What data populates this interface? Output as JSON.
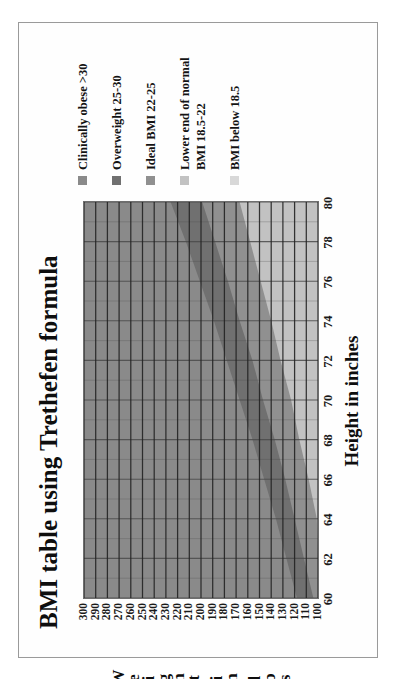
{
  "chart_data": {
    "type": "area",
    "title": "BMI table using Trethefen formula",
    "xlabel": "Height in inches",
    "ylabel": "Weight in lbs",
    "ylabel_letters": [
      "W",
      "e",
      "i",
      "g",
      "h",
      "t",
      "",
      "i",
      "n",
      "",
      "l",
      "b",
      "s"
    ],
    "xlim": [
      60,
      80
    ],
    "ylim": [
      100,
      300
    ],
    "grid": true,
    "legend_position": "right",
    "x": [
      60,
      62,
      64,
      66,
      68,
      70,
      72,
      74,
      76,
      78,
      80
    ],
    "xticklabels": [
      "60",
      "62",
      "64",
      "66",
      "68",
      "70",
      "72",
      "74",
      "76",
      "78",
      "80"
    ],
    "yticklabels": [
      "300",
      "290",
      "280",
      "270",
      "260",
      "250",
      "240",
      "230",
      "220",
      "210",
      "200",
      "190",
      "180",
      "170",
      "160",
      "150",
      "140",
      "130",
      "120",
      "110",
      "100"
    ],
    "yticks": [
      300,
      290,
      280,
      270,
      260,
      250,
      240,
      230,
      220,
      210,
      200,
      190,
      180,
      170,
      160,
      150,
      140,
      130,
      120,
      110,
      100
    ],
    "series": [
      {
        "name": "Clinically obese >30",
        "color": "#8a8a8a",
        "bmi_threshold": 30,
        "boundary_weights_lbs": [
          141,
          152,
          163,
          175,
          187,
          200,
          213,
          227,
          241,
          256,
          271
        ]
      },
      {
        "name": "Overweight 25-30",
        "color": "#707070",
        "bmi_threshold": 25,
        "boundary_weights_lbs": [
          118,
          127,
          136,
          146,
          156,
          167,
          178,
          189,
          201,
          213,
          226
        ]
      },
      {
        "name": "Ideal BMI 22-25",
        "color": "#909090",
        "bmi_threshold": 22,
        "boundary_weights_lbs": [
          104,
          112,
          120,
          128,
          137,
          147,
          156,
          167,
          177,
          188,
          199
        ]
      },
      {
        "name": "Lower end of normal BMI 18.5-22",
        "color": "#c2c2c2",
        "bmi_threshold": 18.5,
        "boundary_weights_lbs": [
          87,
          94,
          101,
          108,
          116,
          123,
          132,
          140,
          149,
          158,
          167
        ]
      },
      {
        "name": "BMI below 18.5",
        "color": "#d8d8d8",
        "bmi_threshold": 0,
        "boundary_weights_lbs": [
          100,
          100,
          100,
          100,
          100,
          100,
          100,
          100,
          100,
          100,
          100
        ]
      }
    ]
  },
  "legend": [
    {
      "label": "Clinically obese >30",
      "color": "#8a8a8a"
    },
    {
      "label": "Overweight 25-30",
      "color": "#707070"
    },
    {
      "label": "Ideal BMI 22-25",
      "color": "#909090"
    },
    {
      "label": "Lower end of normal BMI 18.5-22",
      "color": "#c2c2c2"
    },
    {
      "label": "BMI below 18.5",
      "color": "#d8d8d8"
    }
  ]
}
